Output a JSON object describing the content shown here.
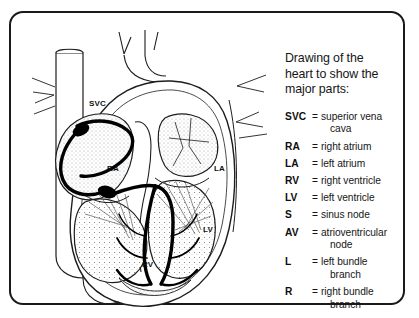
{
  "figure": {
    "title_lines": [
      "Drawing of the",
      "heart to show the",
      "major parts:"
    ],
    "diagram_labels": {
      "svc": "SVC",
      "ra": "RA",
      "la": "LA",
      "rv": "RV",
      "lv": "LV"
    },
    "colors": {
      "border": "#1a1a1a",
      "ink": "#161616",
      "conduction_system": "#000000",
      "background": "#ffffff"
    }
  },
  "legend": {
    "equals_sign": "=",
    "entries": [
      {
        "abbr": "SVC",
        "definition": "superior vena",
        "definition_cont": "cava"
      },
      {
        "abbr": "RA",
        "definition": "right atrium",
        "definition_cont": ""
      },
      {
        "abbr": "LA",
        "definition": "left atrium",
        "definition_cont": ""
      },
      {
        "abbr": "RV",
        "definition": "right ventricle",
        "definition_cont": ""
      },
      {
        "abbr": "LV",
        "definition": "left ventricle",
        "definition_cont": ""
      },
      {
        "abbr": "S",
        "definition": "sinus node",
        "definition_cont": ""
      },
      {
        "abbr": "AV",
        "definition": "atrioventricular",
        "definition_cont": "node"
      },
      {
        "abbr": "L",
        "definition": "left bundle",
        "definition_cont": "branch"
      },
      {
        "abbr": "R",
        "definition": "right bundle",
        "definition_cont": "branch"
      }
    ]
  }
}
